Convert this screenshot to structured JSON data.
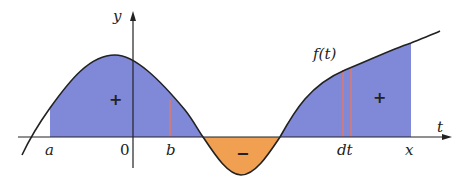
{
  "diagram": {
    "type": "area under curve (integral) illustration",
    "colors": {
      "positive_fill": "#8088d8",
      "negative_fill": "#f0a050",
      "curve": "#222222",
      "strip": "#e07a6a",
      "axis": "#222222"
    },
    "axes": {
      "x_label": "t",
      "y_label": "y",
      "origin_label": "0"
    },
    "curve_label": "f(t)",
    "tick_labels": {
      "a": "a",
      "b": "b",
      "dt": "dt",
      "x": "x"
    },
    "region_signs": {
      "left_positive": "+",
      "negative": "−",
      "right_positive": "+"
    }
  }
}
